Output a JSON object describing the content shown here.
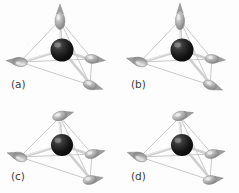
{
  "figure": {
    "background_color": "#fdfdfd",
    "panels": [
      {
        "id": "a",
        "label": "(a)",
        "description": "Two-in two-out type arrangement: apex spin points up, left spin points left, right spin points right, front spin points down-right",
        "central_atom": {
          "name": "central-sphere",
          "color": "#1c1c1c",
          "highlight_color": "#9a9a9a"
        },
        "vertices": [
          {
            "name": "apex",
            "x": 60,
            "y": 18,
            "spin_direction": "up",
            "spin_angle_deg": -90,
            "color": "#b5b5b5"
          },
          {
            "name": "left",
            "x": 20,
            "y": 62,
            "spin_direction": "left",
            "spin_angle_deg": 186,
            "color": "#b0b0b0"
          },
          {
            "name": "right",
            "x": 92,
            "y": 59,
            "spin_direction": "right",
            "spin_angle_deg": 6,
            "color": "#a8a8a8"
          },
          {
            "name": "front",
            "x": 90,
            "y": 85,
            "spin_direction": "down-right",
            "spin_angle_deg": 18,
            "color": "#a5a5a5"
          }
        ]
      },
      {
        "id": "b",
        "label": "(b)",
        "description": "Apex spin points up, left spin points down-left, right spin points right, front spin points down-right",
        "central_atom": {
          "name": "central-sphere",
          "color": "#1c1c1c",
          "highlight_color": "#9a9a9a"
        },
        "vertices": [
          {
            "name": "apex",
            "x": 60,
            "y": 18,
            "spin_direction": "up",
            "spin_angle_deg": -90,
            "color": "#b5b5b5"
          },
          {
            "name": "left",
            "x": 20,
            "y": 62,
            "spin_direction": "down-left",
            "spin_angle_deg": 196,
            "color": "#b0b0b0"
          },
          {
            "name": "right",
            "x": 92,
            "y": 59,
            "spin_direction": "right",
            "spin_angle_deg": 4,
            "color": "#a8a8a8"
          },
          {
            "name": "front",
            "x": 90,
            "y": 85,
            "spin_direction": "down-right",
            "spin_angle_deg": 22,
            "color": "#a5a5a5"
          }
        ]
      },
      {
        "id": "c",
        "label": "(c)",
        "description": "All spins tilted toward upper-right: apex, left, right and front spins all canted in-plane",
        "central_atom": {
          "name": "central-sphere",
          "color": "#1c1c1c",
          "highlight_color": "#9a9a9a"
        },
        "vertices": [
          {
            "name": "apex",
            "x": 60,
            "y": 16,
            "spin_direction": "upper-right",
            "spin_angle_deg": -16,
            "color": "#b5b5b5"
          },
          {
            "name": "left",
            "x": 20,
            "y": 60,
            "spin_direction": "upper-left",
            "spin_angle_deg": 198,
            "color": "#b0b0b0"
          },
          {
            "name": "right",
            "x": 92,
            "y": 57,
            "spin_direction": "upper-right",
            "spin_angle_deg": -14,
            "color": "#a8a8a8"
          },
          {
            "name": "front",
            "x": 90,
            "y": 83,
            "spin_direction": "upper-right",
            "spin_angle_deg": -10,
            "color": "#a5a5a5"
          }
        ]
      },
      {
        "id": "d",
        "label": "(d)",
        "description": "All spins tilted: apex to upper-right, left to upper-left, right and front to upper-right",
        "central_atom": {
          "name": "central-sphere",
          "color": "#1c1c1c",
          "highlight_color": "#9a9a9a"
        },
        "vertices": [
          {
            "name": "apex",
            "x": 60,
            "y": 16,
            "spin_direction": "upper-right",
            "spin_angle_deg": -14,
            "color": "#b5b5b5"
          },
          {
            "name": "left",
            "x": 20,
            "y": 60,
            "spin_direction": "upper-left",
            "spin_angle_deg": 200,
            "color": "#b0b0b0"
          },
          {
            "name": "right",
            "x": 92,
            "y": 57,
            "spin_direction": "upper-right",
            "spin_angle_deg": -12,
            "color": "#a8a8a8"
          },
          {
            "name": "front",
            "x": 90,
            "y": 83,
            "spin_direction": "upper-right",
            "spin_angle_deg": -8,
            "color": "#a5a5a5"
          }
        ]
      }
    ],
    "colors": {
      "edge": "#b9b9b9",
      "bond": "#c4c4c4",
      "label_text": "#3b3b3b",
      "background": "#fdfdfd"
    }
  }
}
